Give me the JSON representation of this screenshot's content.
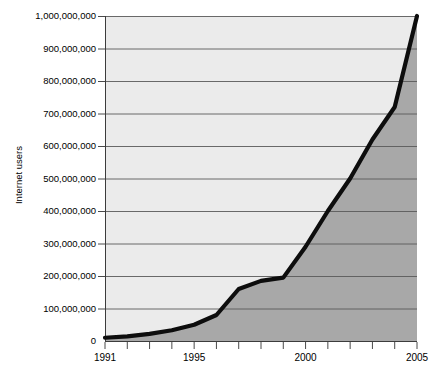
{
  "chart_data": {
    "type": "area",
    "title": "",
    "subtitle": "",
    "xlabel": "",
    "ylabel": "Internet users",
    "x": [
      1991,
      1992,
      1993,
      1994,
      1995,
      1996,
      1997,
      1998,
      1999,
      2000,
      2001,
      2002,
      2003,
      2004,
      2005
    ],
    "values": [
      10000000,
      14000000,
      22000000,
      33000000,
      50000000,
      80000000,
      160000000,
      185000000,
      195000000,
      290000000,
      400000000,
      500000000,
      620000000,
      720000000,
      1000000000
    ],
    "series": [
      {
        "name": "Internet users",
        "values": [
          10000000,
          14000000,
          22000000,
          33000000,
          50000000,
          80000000,
          160000000,
          185000000,
          195000000,
          290000000,
          400000000,
          500000000,
          620000000,
          720000000,
          1000000000
        ]
      }
    ],
    "xlim": [
      1991,
      2005
    ],
    "ylim": [
      0,
      1000000000
    ],
    "y_tick_values": [
      0,
      100000000,
      200000000,
      300000000,
      400000000,
      500000000,
      600000000,
      700000000,
      800000000,
      900000000,
      1000000000
    ],
    "y_tick_labels": [
      "0",
      "100,000,000",
      "200,000,000",
      "300,000,000",
      "400,000,000",
      "500,000,000",
      "600,000,000",
      "700,000,000",
      "800,000,000",
      "900,000,000",
      "1,000,000,000"
    ],
    "x_tick_values": [
      1991,
      1992,
      1993,
      1994,
      1995,
      1996,
      1997,
      1998,
      1999,
      2000,
      2001,
      2002,
      2003,
      2004,
      2005
    ],
    "x_tick_labels": [
      "1991",
      "",
      "",
      "",
      "1995",
      "",
      "",
      "",
      "",
      "2000",
      "",
      "",
      "",
      "",
      "2005"
    ],
    "x_labeled_ticks": [
      "1991",
      "1995",
      "2000",
      "2005"
    ],
    "grid": true,
    "grid_axis": "y",
    "legend": false,
    "legend_position": "none",
    "annotations": [],
    "colors": {
      "area_below_curve": "#a8a8a8",
      "area_above_curve": "#ebebeb",
      "curve_line": "#0d0d0d",
      "gridline": "#5a5a5a",
      "axis": "#3c3c3c",
      "text": "#000000",
      "background": "#ffffff"
    }
  },
  "axes": {
    "y_title": "Internet users",
    "x_title": ""
  }
}
